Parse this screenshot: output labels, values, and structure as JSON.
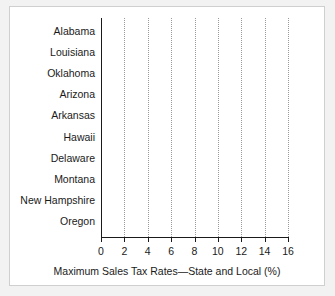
{
  "chart_data": {
    "type": "bar",
    "orientation": "horizontal",
    "title": "",
    "xlabel": "Maximum Sales Tax Rates—State and Local (%)",
    "ylabel": "",
    "xlim": [
      0,
      16
    ],
    "xticks": [
      0,
      2,
      4,
      6,
      8,
      10,
      12,
      14,
      16
    ],
    "xtick_labels": [
      "0",
      "2",
      "4",
      "6",
      "8",
      "10",
      "12",
      "14",
      "16"
    ],
    "grid": "vertical-dotted",
    "legend": "none",
    "categories": [
      "Alabama",
      "Louisiana",
      "Oklahoma",
      "Arizona",
      "Arkansas",
      "Hawaii",
      "Delaware",
      "Montana",
      "New Hampshire",
      "Oregon"
    ],
    "values": [
      15.1,
      10.7,
      10.4,
      10.2,
      9.8,
      4.0,
      0,
      0,
      0,
      0
    ],
    "bar_colors": [
      "#9e9e9e",
      "#7d7d7d",
      "#6b6b6b",
      "#858585",
      "#7a7a7a",
      "#5a5a5a",
      "#808080",
      "#808080",
      "#808080",
      "#808080"
    ]
  },
  "axis": {
    "x_title": "Maximum Sales Tax Rates—State and Local (%)"
  },
  "colors": {
    "background": "#f2f2f2",
    "panel": "#ffffff",
    "axis": "#1a1a1a",
    "grid": "#9a9a9a",
    "text": "#1a1a1a"
  }
}
